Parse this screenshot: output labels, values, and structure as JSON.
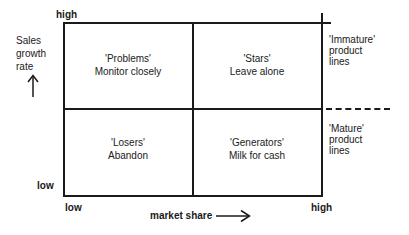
{
  "diagram": {
    "type": "2x2 matrix (growth-share portfolio)",
    "y_axis": {
      "label_lines": [
        "Sales",
        "growth",
        "rate"
      ],
      "high": "high",
      "low": "low",
      "arrow": "up-arrow-icon"
    },
    "x_axis": {
      "label": "market share",
      "low": "low",
      "high": "high",
      "arrow": "right-arrow-icon"
    },
    "quadrants": [
      {
        "position": "top-left",
        "name": "'Problems'",
        "action": "Monitor closely"
      },
      {
        "position": "top-right",
        "name": "'Stars'",
        "action": "Leave alone"
      },
      {
        "position": "bottom-left",
        "name": "'Losers'",
        "action": "Abandon"
      },
      {
        "position": "bottom-right",
        "name": "'Generators'",
        "action": "Milk for cash"
      }
    ],
    "side_labels": {
      "top": [
        "'Immature'",
        "product",
        "lines"
      ],
      "bottom": [
        "'Mature'",
        "product",
        "lines"
      ]
    },
    "colors": {
      "ink": "#1a1a1a",
      "background": "#ffffff"
    }
  }
}
